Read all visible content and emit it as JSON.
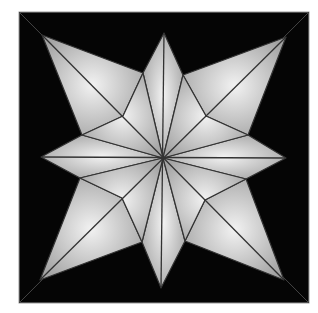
{
  "diagram": {
    "background": "#ffffff",
    "frame": {
      "x": 19,
      "y": 12,
      "width": 290,
      "height": 291,
      "fill": "#050505",
      "stroke": "#9a9a9a"
    },
    "center": [
      163,
      158
    ],
    "star": {
      "fill_light": "#ececec",
      "fill_dark": "#a8a8a8",
      "line_color": "#333333",
      "outline": [
        [
          164,
          33
        ],
        [
          183,
          75
        ],
        [
          206,
          116
        ],
        [
          286,
          37
        ],
        [
          248,
          135
        ],
        [
          206,
          116
        ],
        [
          286,
          158
        ],
        [
          246,
          179
        ],
        [
          205,
          200
        ],
        [
          284,
          280
        ],
        [
          185,
          241
        ],
        [
          205,
          200
        ],
        [
          161,
          288
        ],
        [
          142,
          242
        ],
        [
          122,
          198
        ],
        [
          40,
          280
        ],
        [
          80,
          178
        ],
        [
          122,
          198
        ],
        [
          41,
          157
        ],
        [
          82,
          135
        ],
        [
          123,
          116
        ],
        [
          42,
          35
        ],
        [
          143,
          73
        ],
        [
          123,
          116
        ]
      ],
      "points": {
        "top": [
          164,
          33
        ],
        "right": [
          286,
          158
        ],
        "bottom": [
          161,
          288
        ],
        "left": [
          41,
          157
        ],
        "top_left": [
          42,
          35
        ],
        "top_right": [
          286,
          37
        ],
        "bottom_left": [
          40,
          280
        ],
        "bottom_right": [
          284,
          280
        ]
      },
      "valleys": {
        "n_w": [
          143,
          73
        ],
        "n_e": [
          183,
          75
        ],
        "e_n": [
          248,
          135
        ],
        "e_s": [
          246,
          179
        ],
        "s_e": [
          185,
          241
        ],
        "s_w": [
          142,
          242
        ],
        "w_s": [
          80,
          178
        ],
        "w_n": [
          82,
          135
        ]
      },
      "inner": {
        "nw": [
          123,
          116
        ],
        "ne": [
          206,
          116
        ],
        "se": [
          205,
          200
        ],
        "sw": [
          122,
          198
        ]
      }
    }
  }
}
